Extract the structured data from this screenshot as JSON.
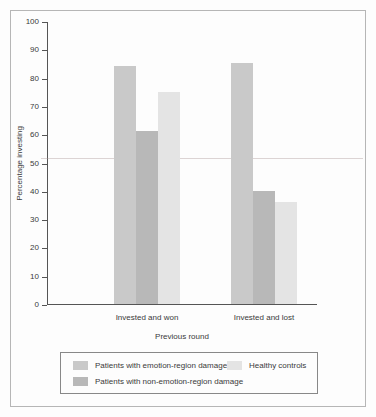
{
  "chart_data": {
    "type": "bar",
    "title": "",
    "xlabel": "Previous round",
    "ylabel": "Percentage investing",
    "categories": [
      "Invested and won",
      "Invested and lost"
    ],
    "ylim": [
      0,
      100
    ],
    "yticks": [
      0,
      10,
      20,
      30,
      40,
      50,
      60,
      70,
      80,
      90,
      100
    ],
    "grid": false,
    "legend_position": "bottom",
    "series": [
      {
        "name": "Patients with emotion-region damage",
        "color": "#c9c9c9",
        "values": [
          84,
          85
        ]
      },
      {
        "name": "Patients with non-emotion-region damage",
        "color": "#b8b8b8",
        "values": [
          61,
          40
        ]
      },
      {
        "name": "Healthy controls",
        "color": "#e4e4e4",
        "values": [
          75,
          36
        ]
      }
    ]
  },
  "legend": {
    "entries": [
      {
        "label": "Patients with emotion-region damage"
      },
      {
        "label": "Patients with non-emotion-region damage"
      },
      {
        "label": "Healthy controls"
      }
    ]
  },
  "colors": {
    "axis": "#555555",
    "frame": "#b6b6b6",
    "legend_border": "#888888",
    "background": "#fdfdfd",
    "text": "#3a3a3a"
  }
}
